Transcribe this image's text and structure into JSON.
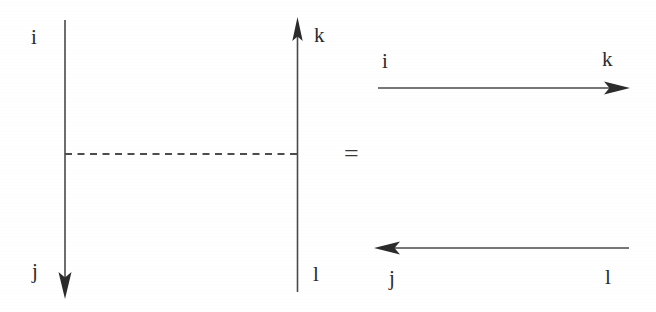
{
  "figure": {
    "kind": "line-diagram",
    "background_color": "#ffffff",
    "ink_color": "#2b2b2b",
    "relation_symbol": "=",
    "left_side": {
      "name": "ladder-rung-diagram",
      "labels": {
        "top_left": "i",
        "bottom_left": "j",
        "top_right": "k",
        "bottom_right": "l"
      },
      "elements": {
        "left_line": {
          "type": "arrow-line",
          "orientation": "vertical",
          "direction": "down",
          "start_label": "i",
          "end_label": "j"
        },
        "right_line": {
          "type": "arrow-line",
          "orientation": "vertical",
          "direction": "up",
          "start_label": "l",
          "end_label": "k"
        },
        "connector": {
          "type": "dashed-line",
          "orientation": "horizontal",
          "style": "dashed"
        }
      }
    },
    "right_side": {
      "name": "two-propagator-diagram",
      "labels": {
        "top_left": "i",
        "top_right": "k",
        "bottom_left": "j",
        "bottom_right": "l"
      },
      "elements": {
        "top_line": {
          "type": "arrow-line",
          "orientation": "horizontal",
          "direction": "right",
          "start_label": "i",
          "end_label": "k"
        },
        "bottom_line": {
          "type": "arrow-line",
          "orientation": "horizontal",
          "direction": "left",
          "start_label": "l",
          "end_label": "j"
        }
      }
    }
  }
}
